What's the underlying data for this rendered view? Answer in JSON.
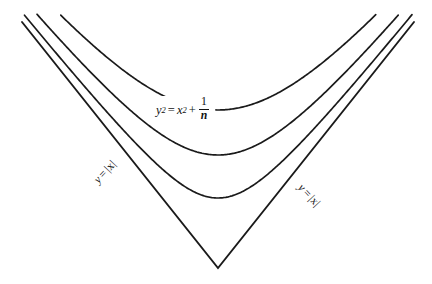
{
  "figure": {
    "kind": "math-figure",
    "width": 432,
    "height": 284,
    "background_color": "#ffffff",
    "stroke_color": "#1a1a1a",
    "text_color": "#111111"
  },
  "labels": {
    "equation": {
      "full_text": "y² = x² + 1/n",
      "y": "y",
      "y_exp": "2",
      "equals": "=",
      "x": "x",
      "x_exp": "2",
      "plus": "+",
      "frac_numerator": "1",
      "frac_denominator": "n"
    },
    "asymptote_left": {
      "full_text": "y = |x|",
      "y": "y",
      "equals": "=",
      "abs_x": "|x|"
    },
    "asymptote_right": {
      "full_text": "y = |x|",
      "y": "y",
      "equals": "=",
      "abs_x": "|x|"
    }
  },
  "chart_data": {
    "type": "line",
    "title": "",
    "xlabel": "",
    "ylabel": "",
    "grid": false,
    "legend": "none",
    "vertex_px": {
      "x": 218,
      "y": 268
    },
    "series": [
      {
        "name": "y = |x|",
        "equation": "y = |x|",
        "kind": "asymptote",
        "path": "M 22,22 L 218,268 L 414,22",
        "vertex_y_px": 268
      },
      {
        "name": "y^2 = x^2 + 1/n, n largest",
        "equation": "y^2 = x^2 + 1/n",
        "kind": "hyperbola",
        "offset_px": 70,
        "vertex_y_px": 198
      },
      {
        "name": "y^2 = x^2 + 1/n, n middle",
        "equation": "y^2 = x^2 + 1/n",
        "kind": "hyperbola",
        "offset_px": 113,
        "vertex_y_px": 155
      },
      {
        "name": "y^2 = x^2 + 1/n, n smallest",
        "equation": "y^2 = x^2 + 1/n",
        "kind": "hyperbola",
        "offset_px": 158,
        "vertex_y_px": 110
      }
    ]
  }
}
